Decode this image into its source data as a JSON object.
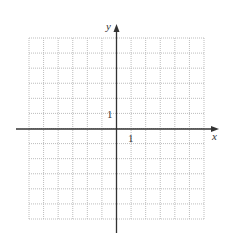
{
  "chart_data": {
    "type": "scatter",
    "title": "",
    "xlabel": "x",
    "ylabel": "y",
    "xlim": [
      -6,
      6
    ],
    "ylim": [
      -6,
      6
    ],
    "grid": true,
    "grid_style": "dotted",
    "tick_labels": {
      "x": [
        "1"
      ],
      "y": [
        "1"
      ]
    },
    "series": []
  },
  "axes": {
    "x_label": "x",
    "y_label": "y",
    "x_tick_label": "1",
    "y_tick_label": "1"
  },
  "colors": {
    "axis": "#333333",
    "grid": "#bdbdbd"
  }
}
